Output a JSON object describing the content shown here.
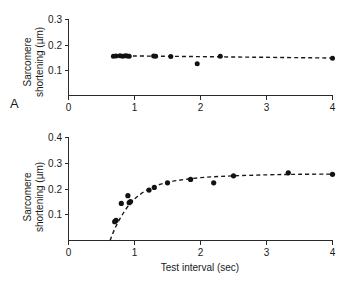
{
  "figure": {
    "panels": [
      {
        "letter": "A",
        "ylabel_line1": "Sarcomere",
        "ylabel_line2": "shortening (µm)",
        "xlabel": "",
        "yticks": [
          "0.1",
          "0.2",
          "0.3"
        ],
        "xticks": [
          "0",
          "1",
          "2",
          "3",
          "4"
        ]
      },
      {
        "letter": "B",
        "ylabel_line1": "Sarcomere",
        "ylabel_line2": "shortening (µm)",
        "xlabel": "Test interval (sec)",
        "yticks": [
          "0.1",
          "0.2",
          "0.3",
          "0.4"
        ],
        "xticks": [
          "0",
          "1",
          "2",
          "3",
          "4"
        ]
      }
    ],
    "colors": {
      "axis": "#2b2b2b",
      "marker": "#121212",
      "curve": "#1a1a1a",
      "background": "#ffffff"
    }
  },
  "chart_data": [
    {
      "type": "scatter",
      "panel": "A",
      "title": "",
      "xlabel": "",
      "ylabel": "Sarcomere shortening (µm)",
      "xlim": [
        0,
        4
      ],
      "ylim": [
        0,
        0.3
      ],
      "xticks": [
        0,
        1,
        2,
        3,
        4
      ],
      "yticks": [
        0.1,
        0.2,
        0.3
      ],
      "grid": false,
      "legend": "none",
      "series": [
        {
          "name": "Sarcomere shortening vs test interval (control)",
          "marker": "filled-circle",
          "x": [
            0.68,
            0.72,
            0.78,
            0.82,
            0.86,
            0.89,
            0.92,
            1.29,
            1.32,
            1.55,
            1.95,
            2.3,
            4.0
          ],
          "y": [
            0.155,
            0.156,
            0.157,
            0.155,
            0.157,
            0.156,
            0.155,
            0.156,
            0.155,
            0.154,
            0.125,
            0.155,
            0.147
          ]
        }
      ],
      "fit": {
        "style": "dashed",
        "description": "flat horizontal fit at plateau",
        "x": [
          0.66,
          4.0
        ],
        "y": [
          0.157,
          0.148
        ]
      },
      "annotations": [
        "A"
      ]
    },
    {
      "type": "scatter",
      "panel": "B",
      "title": "",
      "xlabel": "Test interval (sec)",
      "ylabel": "Sarcomere shortening (µm)",
      "xlim": [
        0,
        4
      ],
      "ylim": [
        0,
        0.4
      ],
      "xticks": [
        0,
        1,
        2,
        3,
        4
      ],
      "yticks": [
        0.1,
        0.2,
        0.3,
        0.4
      ],
      "grid": false,
      "legend": "none",
      "series": [
        {
          "name": "Sarcomere shortening vs test interval (restitution)",
          "marker": "filled-circle",
          "x": [
            0.7,
            0.72,
            0.8,
            0.9,
            0.92,
            0.94,
            1.22,
            1.3,
            1.5,
            1.85,
            2.2,
            2.5,
            3.33,
            4.0
          ],
          "y": [
            0.073,
            0.078,
            0.144,
            0.174,
            0.147,
            0.151,
            0.196,
            0.206,
            0.224,
            0.237,
            0.224,
            0.251,
            0.263,
            0.257
          ]
        }
      ],
      "fit": {
        "style": "dashed",
        "description": "exponential restitution curve rising from ~0.63 s to plateau ~0.26 µm",
        "x": [
          0.63,
          0.7,
          0.78,
          0.86,
          0.95,
          1.05,
          1.2,
          1.4,
          1.65,
          2.0,
          2.4,
          3.0,
          3.5,
          4.0
        ],
        "y": [
          0.0,
          0.045,
          0.085,
          0.118,
          0.148,
          0.172,
          0.198,
          0.219,
          0.233,
          0.244,
          0.25,
          0.255,
          0.257,
          0.258
        ]
      },
      "annotations": [
        "B"
      ]
    }
  ]
}
